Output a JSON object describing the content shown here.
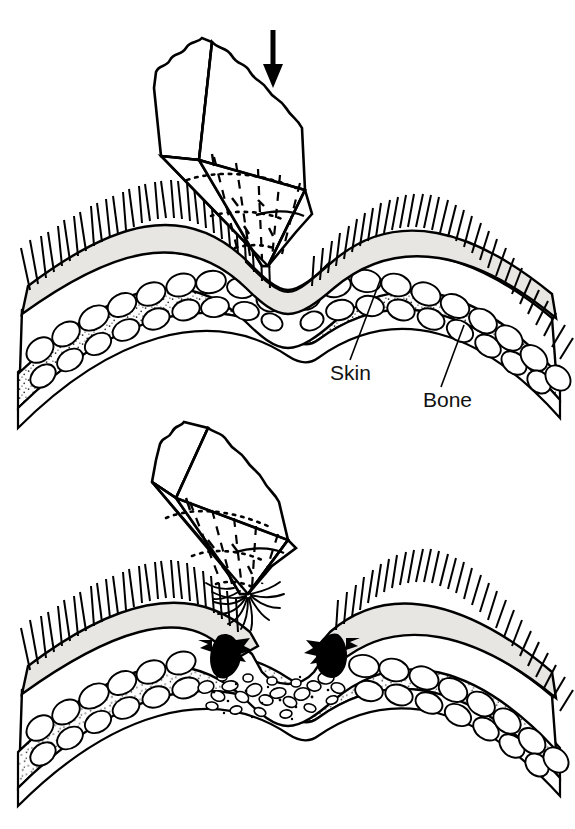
{
  "figure": {
    "background_color": "#ffffff",
    "ink_color": "#000000",
    "skin_layer_color": "#e8e6e2",
    "fat_layer_color": "#ffffff",
    "bone_stipple_color": "#1a1a1a",
    "panels": [
      {
        "id": "panel-top",
        "caption": "",
        "description": "Pointed rock pressed against intact scalp, skin dimpled, force lines radiating from tip",
        "arrow": {
          "name": "force-arrow",
          "direction": "down",
          "label": ""
        }
      },
      {
        "id": "panel-bottom",
        "caption": "",
        "description": "Rock withdrawn after impact, lacerated scalp with torn skin edges and crushed tissue"
      }
    ],
    "labels": [
      {
        "id": "skin",
        "text": "Skin",
        "x": 330,
        "y": 380
      },
      {
        "id": "bone",
        "text": "Bone",
        "x": 423,
        "y": 407
      }
    ],
    "layers": [
      {
        "name": "hair",
        "text": "hair"
      },
      {
        "name": "skin",
        "text": "Skin"
      },
      {
        "name": "subcutaneous-fat",
        "text": "fat"
      },
      {
        "name": "bone",
        "text": "Bone"
      }
    ],
    "object": {
      "name": "rock",
      "text": "rock",
      "force_markers": {
        "radial_dashes": 7,
        "dotted_arcs": 3
      }
    }
  }
}
